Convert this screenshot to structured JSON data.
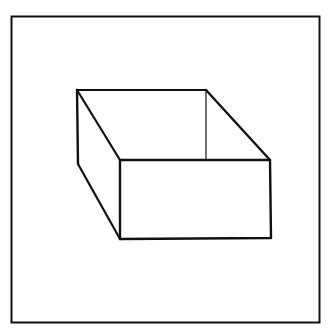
{
  "figure": {
    "stroke_color": "#111111",
    "background_color": "#ffffff",
    "frame": {
      "x": 11,
      "y": 16,
      "width": 309,
      "height": 307
    },
    "box": {
      "back_top_left": [
        77,
        90
      ],
      "back_top_right": [
        206,
        90
      ],
      "front_top_left": [
        120,
        160
      ],
      "front_top_right": [
        270,
        160
      ],
      "front_bottom_left": [
        120,
        239
      ],
      "front_bottom_right": [
        271,
        238
      ],
      "left_bottom_back": [
        78,
        164
      ],
      "inner_back_right_bottom": [
        206,
        160
      ]
    }
  }
}
